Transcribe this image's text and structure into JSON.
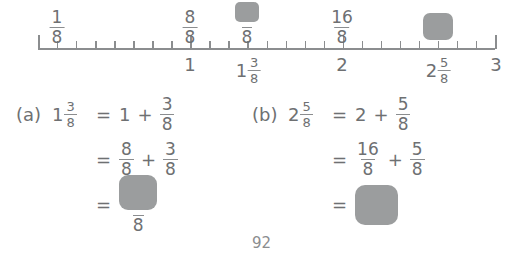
{
  "page": {
    "number": "92",
    "ink_color": "#6e7072",
    "blank_color": "#9b9d9e"
  },
  "numberline": {
    "min": 0,
    "max": 3,
    "denominator": 8,
    "total_ticks": 24,
    "major_ticks": [
      "0",
      "1",
      "2",
      "3"
    ],
    "above_labels": [
      {
        "value_eighths": 1,
        "type": "fraction",
        "numerator": "1",
        "denominator": "8"
      },
      {
        "value_eighths": 8,
        "type": "fraction",
        "numerator": "8",
        "denominator": "8"
      },
      {
        "value_eighths": 11,
        "type": "blank-fraction",
        "numerator": "",
        "denominator": "8"
      },
      {
        "value_eighths": 16,
        "type": "fraction",
        "numerator": "16",
        "denominator": "8"
      },
      {
        "value_eighths": 21,
        "type": "blank",
        "numerator": "",
        "denominator": ""
      }
    ],
    "below_labels": [
      {
        "value_eighths": 8,
        "type": "whole",
        "whole": "1"
      },
      {
        "value_eighths": 11,
        "type": "mixed",
        "whole": "1",
        "numerator": "3",
        "denominator": "8"
      },
      {
        "value_eighths": 16,
        "type": "whole",
        "whole": "2"
      },
      {
        "value_eighths": 21,
        "type": "mixed",
        "whole": "2",
        "numerator": "5",
        "denominator": "8"
      },
      {
        "value_eighths": 24,
        "type": "whole",
        "whole": "3"
      }
    ]
  },
  "examples": [
    {
      "tag": "(a)",
      "lhs": {
        "whole": "1",
        "numerator": "3",
        "denominator": "8"
      },
      "rows": [
        {
          "equals": "=",
          "terms": [
            {
              "kind": "whole",
              "text": "1"
            },
            {
              "kind": "plus",
              "text": "+"
            },
            {
              "kind": "fraction",
              "numerator": "3",
              "denominator": "8"
            }
          ]
        },
        {
          "equals": "=",
          "terms": [
            {
              "kind": "fraction",
              "numerator": "8",
              "denominator": "8"
            },
            {
              "kind": "plus",
              "text": "+"
            },
            {
              "kind": "fraction",
              "numerator": "3",
              "denominator": "8"
            }
          ]
        },
        {
          "equals": "=",
          "terms": [
            {
              "kind": "blank-fraction",
              "numerator": "",
              "denominator": "8"
            }
          ]
        }
      ]
    },
    {
      "tag": "(b)",
      "lhs": {
        "whole": "2",
        "numerator": "5",
        "denominator": "8"
      },
      "rows": [
        {
          "equals": "=",
          "terms": [
            {
              "kind": "whole",
              "text": "2"
            },
            {
              "kind": "plus",
              "text": "+"
            },
            {
              "kind": "fraction",
              "numerator": "5",
              "denominator": "8"
            }
          ]
        },
        {
          "equals": "=",
          "terms": [
            {
              "kind": "fraction",
              "numerator": "16",
              "denominator": "8"
            },
            {
              "kind": "plus",
              "text": "+"
            },
            {
              "kind": "fraction",
              "numerator": "5",
              "denominator": "8"
            }
          ]
        },
        {
          "equals": "=",
          "terms": [
            {
              "kind": "blank-box",
              "text": ""
            }
          ]
        }
      ]
    }
  ]
}
